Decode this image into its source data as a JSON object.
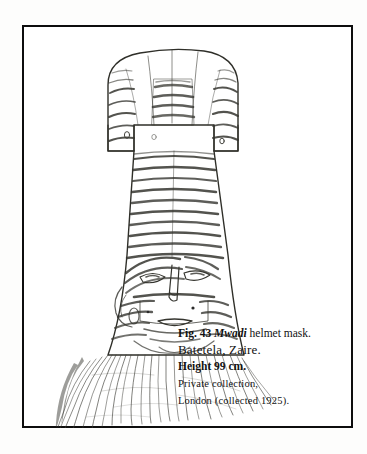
{
  "page": {
    "background_color": "#fdfdfc",
    "plate_background_color": "#ffffff",
    "frame_color": "#0d0d0d"
  },
  "figure": {
    "alt": "Line drawing of a Mwadi helmet mask with striped dome crown, long striped neck, carved face and long raffia fiber beard",
    "ink_color": "#2b2b2b"
  },
  "caption": {
    "fig_number": "Fig. 43",
    "object_name": "Mwadi",
    "title_rest": "helmet mask.",
    "line1_full": "Fig. 43 Mwadi helmet mask.",
    "line2_origin": "Batetela, Zaire.",
    "line3_height": "Height 99 cm.",
    "line4_credit": "Private collection,",
    "line5_provenance": "London (collected 1925)."
  }
}
